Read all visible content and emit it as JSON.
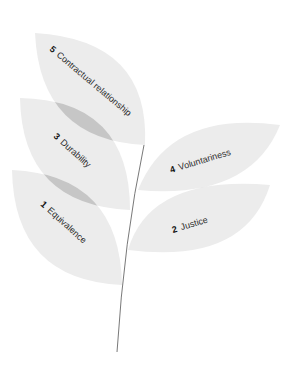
{
  "diagram": {
    "leaves": [
      {
        "number": "5",
        "label": "Contractual relationship"
      },
      {
        "number": "3",
        "label": "Durability"
      },
      {
        "number": "1",
        "label": "Equivalence"
      },
      {
        "number": "4",
        "label": "Voluntariness"
      },
      {
        "number": "2",
        "label": "Justice"
      }
    ],
    "colors": {
      "leaf": "#ebebeb",
      "overlap": "#c6c6c6",
      "stem": "#555555",
      "text": "#2a2a2a"
    }
  }
}
